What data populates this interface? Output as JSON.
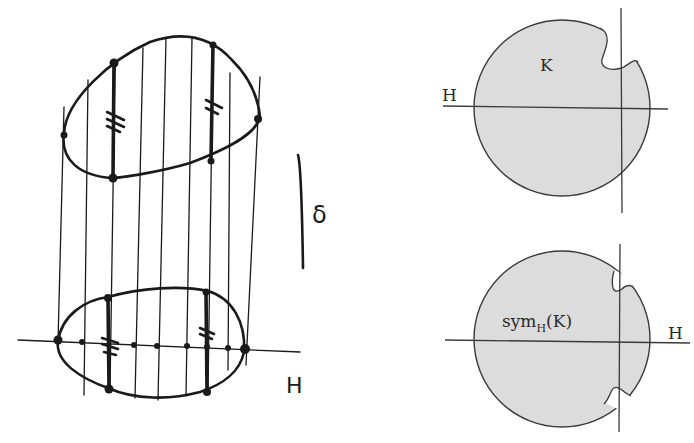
{
  "figure": {
    "left_sketch": {
      "axis_label": "H",
      "direction_label": "δ",
      "description": "Steiner symmetrization sketch: upper convex body with vertical chords projected onto line H, lower symmetrized body"
    },
    "top_right": {
      "set_label": "K",
      "axis_label": "H",
      "fill_color": "#dcdcdc"
    },
    "bottom_right": {
      "set_label_main": "sym",
      "set_label_sub": "H",
      "set_label_arg": "(K)",
      "axis_label": "H",
      "fill_color": "#dcdcdc"
    }
  }
}
